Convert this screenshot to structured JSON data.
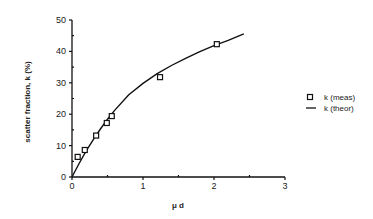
{
  "chart_data": {
    "type": "scatter",
    "title": "",
    "xlabel": "μ d",
    "ylabel": "scatter fraction, k (%)",
    "xlim": [
      0,
      3
    ],
    "ylim": [
      0,
      50
    ],
    "x_ticks": [
      0,
      1,
      2,
      3
    ],
    "x_minor_ticks": [
      0.5,
      1.5,
      2.5
    ],
    "y_ticks": [
      0,
      10,
      20,
      30,
      40,
      50
    ],
    "y_minor_ticks": [
      5,
      15,
      25,
      35,
      45
    ],
    "grid": false,
    "legend_position": "right",
    "series": [
      {
        "name": "k (meas)",
        "type": "scatter",
        "marker": "open-square",
        "x": [
          0.08,
          0.18,
          0.34,
          0.49,
          0.56,
          1.24,
          2.04
        ],
        "y": [
          6.4,
          8.6,
          13.2,
          17.2,
          19.4,
          31.8,
          42.3
        ]
      },
      {
        "name": "k (theor)",
        "type": "line",
        "x": [
          0,
          0.1,
          0.2,
          0.3,
          0.4,
          0.5,
          0.6,
          0.8,
          1.0,
          1.2,
          1.4,
          1.6,
          1.8,
          2.0,
          2.2,
          2.42
        ],
        "y": [
          0,
          4.3,
          8.3,
          11.9,
          15.3,
          18.4,
          21.2,
          26.2,
          29.8,
          32.9,
          35.5,
          37.8,
          39.9,
          41.8,
          43.5,
          45.6
        ]
      }
    ]
  },
  "legend": {
    "meas_label": "k (meas)",
    "theor_label": "k (theor)"
  },
  "axes": {
    "x_label": "μ d",
    "y_label": "scatter fraction, k (%)",
    "x_tick_labels": [
      "0",
      "1",
      "2",
      "3"
    ],
    "y_tick_labels": [
      "0",
      "10",
      "20",
      "30",
      "40",
      "50"
    ]
  }
}
